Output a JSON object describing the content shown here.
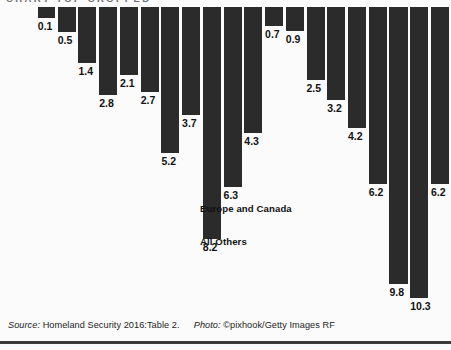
{
  "figure": {
    "cropped_header_text": "CHART TOP CROPPED",
    "background_color": "#fbfbfb",
    "bar_color": "#2b2b2b",
    "label_color": "#121212"
  },
  "annotations": [
    {
      "text": "Europe and Canada",
      "x": 200,
      "y": 203
    },
    {
      "text": "All Others",
      "x": 200,
      "y": 236
    }
  ],
  "credit": {
    "source_label": "Source:",
    "source_text": "Homeland Security 2016:Table 2.",
    "photo_label": "Photo:",
    "photo_text": "©pixhook/Getty Images RF"
  },
  "chart_data": {
    "type": "bar",
    "title": "",
    "subtitle": "",
    "xlabel": "",
    "ylabel": "",
    "orientation": "vertical-downward",
    "note": "Bars hang downward from the top edge; the category axis and chart title are cropped off the top of the image. Value labels sit just below the end of each bar.",
    "grid": false,
    "legend_position": "in-plot annotations",
    "value_range": [
      0.1,
      10.3
    ],
    "categories": [
      "bar-1",
      "bar-2",
      "bar-3",
      "bar-4",
      "bar-5",
      "bar-6",
      "bar-7",
      "bar-8",
      "bar-9",
      "bar-10",
      "bar-11",
      "bar-12",
      "bar-13",
      "bar-14",
      "bar-15",
      "bar-16",
      "bar-17",
      "bar-18",
      "bar-19",
      "bar-20"
    ],
    "values": [
      0.1,
      0.5,
      1.4,
      2.8,
      2.1,
      2.7,
      5.2,
      3.7,
      8.2,
      6.3,
      4.3,
      0.7,
      0.9,
      2.5,
      3.2,
      4.2,
      6.2,
      9.8,
      10.3,
      6.2
    ],
    "labels": [
      "0.1",
      "0.5",
      "1.4",
      "2.8",
      "2.1",
      "2.7",
      "5.2",
      "3.7",
      "8.2",
      "6.3",
      "4.3",
      "0.7",
      "0.9",
      "2.5",
      "3.2",
      "4.2",
      "6.2",
      "9.8",
      "10.3",
      "6.2"
    ],
    "bar_geometry": [
      {
        "x": 42,
        "w": 19,
        "h": 11
      },
      {
        "x": 64,
        "w": 20,
        "h": 25
      },
      {
        "x": 87,
        "w": 20,
        "h": 56
      },
      {
        "x": 110,
        "w": 20,
        "h": 88
      },
      {
        "x": 133,
        "w": 20,
        "h": 68
      },
      {
        "x": 156,
        "w": 20,
        "h": 85
      },
      {
        "x": 179,
        "w": 20,
        "h": 146
      },
      {
        "x": 202,
        "w": 20,
        "h": 108
      },
      {
        "x": 225,
        "w": 20,
        "h": 232
      },
      {
        "x": 248,
        "w": 20,
        "h": 180
      },
      {
        "x": 271,
        "w": 20,
        "h": 126
      },
      {
        "x": 294,
        "w": 20,
        "h": 19
      },
      {
        "x": 317,
        "w": 20,
        "h": 24
      },
      {
        "x": 340,
        "w": 20,
        "h": 73
      },
      {
        "x": 363,
        "w": 20,
        "h": 93
      },
      {
        "x": 386,
        "w": 20,
        "h": 121
      },
      {
        "x": 409,
        "w": 20,
        "h": 177
      },
      {
        "x": 432,
        "w": 20,
        "h": 277
      },
      {
        "x": 455,
        "w": 20,
        "h": 291
      },
      {
        "x": 478,
        "w": 20,
        "h": 177
      }
    ]
  }
}
